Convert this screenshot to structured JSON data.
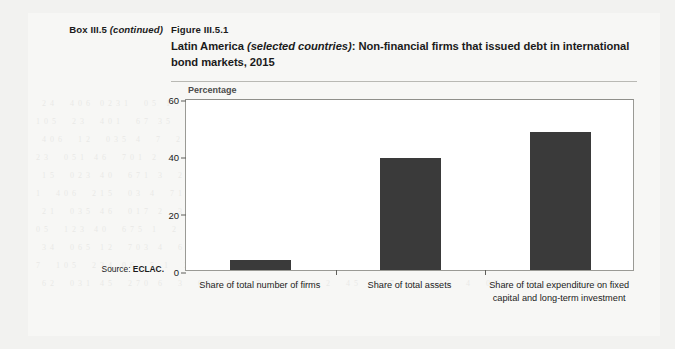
{
  "box": {
    "label_main": "Box III.5",
    "label_note": "(continued)"
  },
  "figure": {
    "number": "Figure III.5.1",
    "title_part1": "Latin America ",
    "title_italic": "(selected countries)",
    "title_part2": ": Non-financial firms that issued debt in international bond markets, 2015"
  },
  "source": {
    "prefix": "Source: ",
    "value": "ECLAC."
  },
  "chart_data": {
    "type": "bar",
    "title": "Latin America (selected countries): Non-financial firms that issued debt in international bond markets, 2015",
    "subtitle": "",
    "unit_label": "Percentage",
    "xlabel": "",
    "ylabel": "Percentage",
    "ylim": [
      0,
      60
    ],
    "yticks": [
      0,
      20,
      40,
      60
    ],
    "ytick_labels": [
      "0",
      "20",
      "40",
      "60"
    ],
    "grid": false,
    "legend": "none",
    "categories": [
      "Share of total number of firms",
      "Share of total assets",
      "Share of total expenditure on fixed capital and long-term investment"
    ],
    "values": [
      3.4,
      39.0,
      48.0
    ],
    "bar_color": "#3a3a3a"
  },
  "colors": {
    "page_background": "#f2f2f0",
    "paper": "#f7f7f5",
    "plot_background": "#ffffff",
    "axis": "#5e5e5a",
    "text": "#1b1b1b",
    "unit_text": "#4b4b4b",
    "rule": "#b9b9b4"
  }
}
